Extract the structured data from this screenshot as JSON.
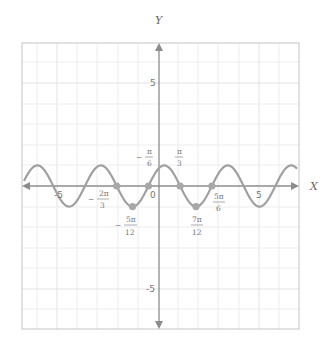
{
  "chart_data": {
    "type": "line",
    "title": "",
    "function": "y = sin(2x + π/3)",
    "xlabel": "X",
    "ylabel": "Y",
    "xlim": [
      -6.8,
      7.0
    ],
    "ylim": [
      -7.0,
      7.0
    ],
    "grid": true,
    "x_ticks": [
      {
        "value": -5,
        "label": "-5"
      },
      {
        "value": 0,
        "label": "0"
      },
      {
        "value": 5,
        "label": "5"
      }
    ],
    "y_ticks": [
      {
        "value": 5,
        "label": "5"
      },
      {
        "value": -5,
        "label": "-5"
      }
    ],
    "series": [
      {
        "name": "f(x)",
        "color": "#a0a0a0",
        "amplitude": 1,
        "angular_frequency": 2,
        "phase": 1.0472
      }
    ],
    "marked_points": [
      {
        "x": -2.0944,
        "y": 0,
        "label_sign": "−",
        "label_num": "2π",
        "label_den": "3"
      },
      {
        "x": -1.309,
        "y": -1,
        "label_sign": "−",
        "label_num": "5π",
        "label_den": "12"
      },
      {
        "x": -0.5236,
        "y": 0,
        "label_sign": "−",
        "label_num": "π",
        "label_den": "6"
      },
      {
        "x": 1.0472,
        "y": 0,
        "label_sign": "",
        "label_num": "π",
        "label_den": "3"
      },
      {
        "x": 1.8326,
        "y": -1,
        "label_sign": "",
        "label_num": "7π",
        "label_den": "12"
      },
      {
        "x": 2.618,
        "y": 0,
        "label_sign": "",
        "label_num": "5π",
        "label_den": "6"
      }
    ]
  },
  "labels": {
    "x_axis": "X",
    "y_axis": "Y",
    "origin": "0",
    "x_neg5": "-5",
    "x_pos5": "5",
    "y_pos5": "5",
    "y_neg5": "-5",
    "p1_sign": "−",
    "p1_num": "2π",
    "p1_den": "3",
    "p2_sign": "−",
    "p2_num": "5π",
    "p2_den": "12",
    "p3_sign": "−",
    "p3_num": "π",
    "p3_den": "6",
    "p4_num": "π",
    "p4_den": "3",
    "p5_num": "7π",
    "p5_den": "12",
    "p6_num": "5π",
    "p6_den": "6"
  },
  "colors": {
    "curve": "#a0a0a0",
    "axis": "#8c8c8c",
    "grid": "#ececec",
    "frame": "#bdbdbd",
    "points": "#a8a8a8"
  }
}
